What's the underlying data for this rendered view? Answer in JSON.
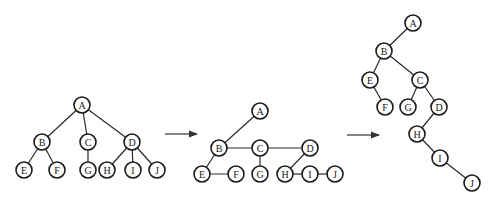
{
  "node_radius": 8,
  "colors": {
    "stroke": "#1a1a1a",
    "fill": "#ffffff",
    "background": "#ffffff"
  },
  "diagrams": [
    {
      "name": "original-tree",
      "nodes": [
        {
          "id": "A",
          "label": "A",
          "x": 82,
          "y": 105
        },
        {
          "id": "B",
          "label": "B",
          "x": 42,
          "y": 142
        },
        {
          "id": "C",
          "label": "C",
          "x": 88,
          "y": 142
        },
        {
          "id": "D",
          "label": "D",
          "x": 132,
          "y": 142
        },
        {
          "id": "E",
          "label": "E",
          "x": 24,
          "y": 170
        },
        {
          "id": "F",
          "label": "F",
          "x": 57,
          "y": 170
        },
        {
          "id": "G",
          "label": "G",
          "x": 88,
          "y": 170
        },
        {
          "id": "H",
          "label": "H",
          "x": 107,
          "y": 170
        },
        {
          "id": "I",
          "label": "I",
          "x": 133,
          "y": 170
        },
        {
          "id": "J",
          "label": "J",
          "x": 157,
          "y": 170
        }
      ],
      "edges": [
        [
          "A",
          "B"
        ],
        [
          "A",
          "C"
        ],
        [
          "A",
          "D"
        ],
        [
          "B",
          "E"
        ],
        [
          "B",
          "F"
        ],
        [
          "C",
          "G"
        ],
        [
          "D",
          "H"
        ],
        [
          "D",
          "I"
        ],
        [
          "D",
          "J"
        ]
      ]
    },
    {
      "name": "sibling-linked-tree",
      "nodes": [
        {
          "id": "A",
          "label": "A",
          "x": 260,
          "y": 111
        },
        {
          "id": "B",
          "label": "B",
          "x": 219,
          "y": 148
        },
        {
          "id": "C",
          "label": "C",
          "x": 260,
          "y": 148
        },
        {
          "id": "D",
          "label": "D",
          "x": 310,
          "y": 148
        },
        {
          "id": "E",
          "label": "E",
          "x": 202,
          "y": 174
        },
        {
          "id": "F",
          "label": "F",
          "x": 236,
          "y": 174
        },
        {
          "id": "G",
          "label": "G",
          "x": 260,
          "y": 174
        },
        {
          "id": "H",
          "label": "H",
          "x": 285,
          "y": 174
        },
        {
          "id": "I",
          "label": "I",
          "x": 310,
          "y": 174
        },
        {
          "id": "J",
          "label": "J",
          "x": 335,
          "y": 174
        }
      ],
      "edges": [
        [
          "A",
          "B"
        ],
        [
          "B",
          "C"
        ],
        [
          "C",
          "D"
        ],
        [
          "B",
          "E"
        ],
        [
          "E",
          "F"
        ],
        [
          "C",
          "G"
        ],
        [
          "D",
          "H"
        ],
        [
          "H",
          "I"
        ],
        [
          "I",
          "J"
        ]
      ]
    },
    {
      "name": "binary-tree",
      "nodes": [
        {
          "id": "A",
          "label": "A",
          "x": 413,
          "y": 23
        },
        {
          "id": "B",
          "label": "B",
          "x": 384,
          "y": 51
        },
        {
          "id": "E",
          "label": "E",
          "x": 370,
          "y": 80
        },
        {
          "id": "C",
          "label": "C",
          "x": 420,
          "y": 80
        },
        {
          "id": "F",
          "label": "F",
          "x": 385,
          "y": 107
        },
        {
          "id": "G",
          "label": "G",
          "x": 408,
          "y": 107
        },
        {
          "id": "D",
          "label": "D",
          "x": 439,
          "y": 107
        },
        {
          "id": "H",
          "label": "H",
          "x": 417,
          "y": 134
        },
        {
          "id": "I",
          "label": "I",
          "x": 440,
          "y": 158
        },
        {
          "id": "J",
          "label": "J",
          "x": 472,
          "y": 183
        }
      ],
      "edges": [
        [
          "A",
          "B"
        ],
        [
          "B",
          "E"
        ],
        [
          "B",
          "C"
        ],
        [
          "E",
          "F"
        ],
        [
          "C",
          "G"
        ],
        [
          "C",
          "D"
        ],
        [
          "D",
          "H"
        ],
        [
          "H",
          "I"
        ],
        [
          "I",
          "J"
        ]
      ]
    }
  ],
  "arrows": [
    {
      "name": "arrow-1",
      "x1": 165,
      "y1": 134,
      "x2": 197,
      "y2": 134
    },
    {
      "name": "arrow-2",
      "x1": 347,
      "y1": 135,
      "x2": 379,
      "y2": 135
    }
  ]
}
